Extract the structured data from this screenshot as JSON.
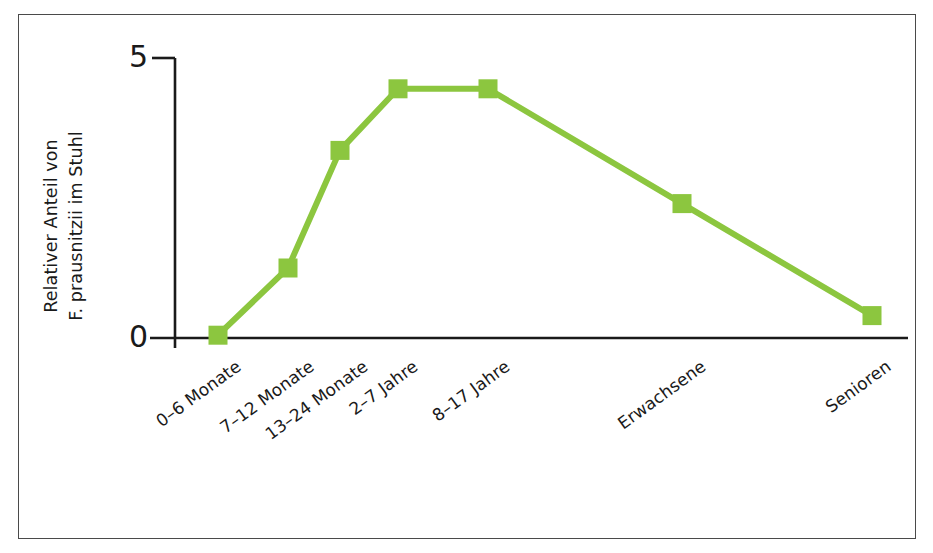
{
  "figure": {
    "border_color": "#4a4a4a",
    "background": "#ffffff"
  },
  "chart_data": {
    "type": "line",
    "title": "",
    "subtitle": "",
    "xlabel": "",
    "ylabel": "Relativer Anteil von F. prausnitzii im Stuhl",
    "ylabel_lines": [
      "Relativer Anteil von",
      "F. prausnitzii im Stuhl"
    ],
    "categories": [
      "0–6 Monate",
      "7–12 Monate",
      "13–24 Monate",
      "2–7 Jahre",
      "8–17 Jahre",
      "Erwachsene",
      "Senioren"
    ],
    "values": [
      0.05,
      1.25,
      3.35,
      4.45,
      4.45,
      2.4,
      0.4
    ],
    "ylim": [
      0,
      5
    ],
    "ytick_labels": [
      "0",
      "5"
    ],
    "ytick_values": [
      0,
      5
    ],
    "grid": false,
    "legend": null,
    "series": [
      {
        "name": "F. prausnitzii",
        "color": "#8CC63F",
        "marker": "square",
        "values": [
          0.05,
          1.25,
          3.35,
          4.45,
          4.45,
          2.4,
          0.4
        ]
      }
    ],
    "line_color": "#8CC63F",
    "marker_color": "#8CC63F",
    "axis_color": "#1a1a1a"
  },
  "axes": {
    "x_axis_name": "x-axis-baseline",
    "y_axis_name": "y-axis-line"
  }
}
